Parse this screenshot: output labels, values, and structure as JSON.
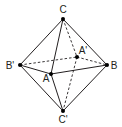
{
  "diagram": {
    "vertices": [
      {
        "id": "C",
        "label": "C",
        "x": 63,
        "y": 19,
        "lx": 63,
        "ly": 13
      },
      {
        "id": "Bp",
        "label": "B'",
        "x": 20,
        "y": 65,
        "lx": 10,
        "ly": 69
      },
      {
        "id": "B",
        "label": "B",
        "x": 107,
        "y": 65,
        "lx": 114,
        "ly": 69
      },
      {
        "id": "A",
        "label": "A",
        "x": 51,
        "y": 74,
        "lx": 46,
        "ly": 82
      },
      {
        "id": "Ap",
        "label": "A'",
        "x": 77,
        "y": 57,
        "lx": 83,
        "ly": 54
      },
      {
        "id": "Cp",
        "label": "C'",
        "x": 63,
        "y": 111,
        "lx": 63,
        "ly": 123
      }
    ],
    "solid_edges": [
      [
        "C",
        "Bp"
      ],
      [
        "C",
        "A"
      ],
      [
        "C",
        "B"
      ],
      [
        "Bp",
        "A"
      ],
      [
        "A",
        "B"
      ],
      [
        "Bp",
        "Cp"
      ],
      [
        "A",
        "Cp"
      ],
      [
        "B",
        "Cp"
      ]
    ],
    "dashed_edges": [
      [
        "C",
        "Ap"
      ],
      [
        "Ap",
        "Cp"
      ],
      [
        "Bp",
        "Ap"
      ],
      [
        "Ap",
        "B"
      ]
    ],
    "colors": {
      "stroke": "#231f20",
      "point": "#000000",
      "background": "#ffffff"
    }
  }
}
